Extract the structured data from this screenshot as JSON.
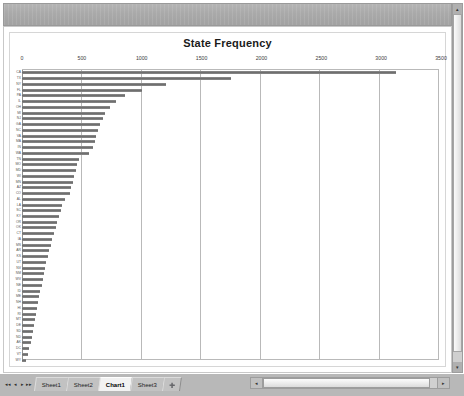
{
  "window": {
    "toolbar_label": ""
  },
  "chart_data": {
    "type": "bar",
    "orientation": "horizontal",
    "title": "State Frequency",
    "xlabel": "",
    "ylabel": "",
    "xlim": [
      0,
      3500
    ],
    "xticks": [
      0,
      500,
      1000,
      1500,
      2000,
      2500,
      3000,
      3500
    ],
    "xtick_labels": [
      "0",
      "500",
      "1000",
      "1500",
      "2000",
      "2500",
      "3000",
      "3500"
    ],
    "grid": true,
    "legend": false,
    "bar_color": "#7a7a7a",
    "categories": [
      "CA",
      "TX",
      "NY",
      "FL",
      "PA",
      "IL",
      "OH",
      "MI",
      "NJ",
      "GA",
      "NC",
      "VA",
      "MA",
      "IN",
      "WA",
      "TN",
      "MO",
      "MD",
      "WI",
      "MN",
      "AZ",
      "CO",
      "AL",
      "LA",
      "SC",
      "KY",
      "OR",
      "OK",
      "CT",
      "IA",
      "MS",
      "AR",
      "KS",
      "UT",
      "NV",
      "NM",
      "WV",
      "NE",
      "ID",
      "ME",
      "NH",
      "HI",
      "RI",
      "MT",
      "DE",
      "SD",
      "ND",
      "AK",
      "DC",
      "VT",
      "WY"
    ],
    "values": [
      3150,
      1760,
      1210,
      1010,
      870,
      790,
      740,
      700,
      680,
      660,
      640,
      625,
      610,
      600,
      560,
      480,
      465,
      455,
      440,
      430,
      415,
      400,
      360,
      340,
      325,
      310,
      295,
      285,
      270,
      255,
      240,
      230,
      220,
      205,
      195,
      185,
      175,
      165,
      155,
      145,
      135,
      125,
      118,
      110,
      100,
      92,
      84,
      72,
      60,
      48,
      30
    ]
  },
  "tabs": {
    "nav_first": "◂◂",
    "nav_prev": "◂",
    "nav_next": "▸",
    "nav_last": "▸▸",
    "items": [
      {
        "label": "Sheet1",
        "active": false
      },
      {
        "label": "Sheet2",
        "active": false
      },
      {
        "label": "Chart1",
        "active": true
      },
      {
        "label": "Sheet3",
        "active": false
      }
    ],
    "new_sheet_label": "➕"
  },
  "scrollbars": {
    "h_left_arrow": "◂",
    "h_right_arrow": "▸",
    "v_up_arrow": "▴",
    "v_down_arrow": "▾"
  }
}
